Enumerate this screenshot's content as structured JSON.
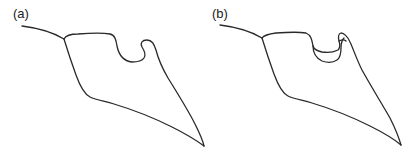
{
  "figure": {
    "panels": [
      {
        "label": "(a)",
        "description": "Outline drawing of a shape with a raised lobe and a notch on the top edge"
      },
      {
        "label": "(b)",
        "description": "Same outline drawing where the notch on the top edge forms a closed pocket under the lobe"
      }
    ],
    "stroke_color": "#2a2a2a",
    "background_color": "#ffffff"
  }
}
